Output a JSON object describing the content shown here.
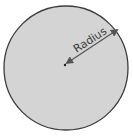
{
  "diagram": {
    "shape": "circle",
    "label": "Radius",
    "colors": {
      "fill": "#d4d4d4",
      "stroke": "#3c3c3c",
      "arrow": "#555555",
      "text": "#3a3a3a",
      "center_dot": "#222222"
    }
  }
}
